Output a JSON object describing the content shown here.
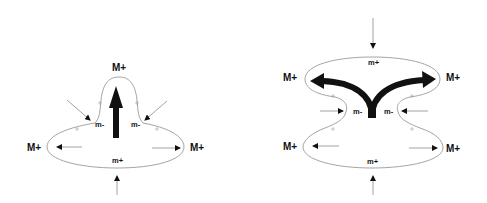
{
  "diagram": {
    "left_panel": {
      "labels": {
        "top": "M+",
        "left": "M+",
        "right": "M+",
        "neck_left": "m-",
        "neck_right": "m-",
        "bottom": "m+"
      },
      "main_arrow": "upward"
    },
    "right_panel": {
      "labels": {
        "upper_left": "M+",
        "upper_right": "M+",
        "lower_left": "M+",
        "lower_right": "M+",
        "top": "m+",
        "waist_left": "m-",
        "waist_right": "m-",
        "bottom": "m+"
      },
      "main_arrow": "split-left-right"
    },
    "colors": {
      "outline": "#9a9a9a",
      "arrow": "#111111",
      "text": "#111111"
    }
  }
}
